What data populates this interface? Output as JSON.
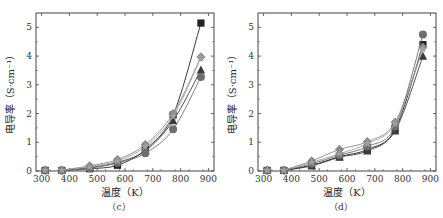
{
  "chart_data": [
    {
      "type": "line",
      "panel_label": "（c）",
      "title": "",
      "xlabel": "温度（K）",
      "ylabel": "电导率（S·cm⁻¹）",
      "xlim": [
        280,
        920
      ],
      "ylim": [
        0,
        5.5
      ],
      "xticks": [
        300,
        400,
        500,
        600,
        700,
        800,
        900
      ],
      "yticks": [
        0,
        1,
        2,
        3,
        4,
        5
      ],
      "grid": false,
      "legend": "none",
      "x": [
        313,
        373,
        473,
        573,
        673,
        773,
        873
      ],
      "series": [
        {
          "name": "square",
          "marker": "square",
          "color": "#222222",
          "values": [
            0.02,
            0.02,
            0.08,
            0.2,
            0.75,
            1.95,
            5.15
          ]
        },
        {
          "name": "diamond",
          "marker": "diamond",
          "color": "#8a8a8a",
          "values": [
            0.03,
            0.03,
            0.18,
            0.4,
            0.92,
            2.0,
            3.97
          ]
        },
        {
          "name": "triangle",
          "marker": "triangle",
          "color": "#3a3a3a",
          "values": [
            0.02,
            0.02,
            0.12,
            0.3,
            0.7,
            1.75,
            3.52
          ]
        },
        {
          "name": "circle",
          "marker": "circle",
          "color": "#6e6e6e",
          "values": [
            0.02,
            0.02,
            0.1,
            0.28,
            0.62,
            1.45,
            3.27
          ]
        },
        {
          "name": "star",
          "marker": "star",
          "color": "#a0a0a0",
          "values": [
            0.03,
            0.03,
            0.15,
            0.35,
            0.85,
            1.9,
            3.95
          ]
        }
      ]
    },
    {
      "type": "line",
      "panel_label": "（d）",
      "title": "",
      "xlabel": "温度（K）",
      "ylabel": "电导率（S·cm⁻¹）",
      "xlim": [
        280,
        920
      ],
      "ylim": [
        0,
        5.5
      ],
      "xticks": [
        300,
        400,
        500,
        600,
        700,
        800,
        900
      ],
      "yticks": [
        0,
        1,
        2,
        3,
        4,
        5
      ],
      "grid": false,
      "legend": "none",
      "x": [
        313,
        373,
        473,
        573,
        673,
        773,
        873
      ],
      "series": [
        {
          "name": "square",
          "marker": "square",
          "color": "#222222",
          "values": [
            0.02,
            0.02,
            0.2,
            0.5,
            0.75,
            1.45,
            4.4
          ]
        },
        {
          "name": "diamond",
          "marker": "diamond",
          "color": "#8a8a8a",
          "values": [
            0.03,
            0.03,
            0.35,
            0.75,
            1.02,
            1.7,
            4.3
          ]
        },
        {
          "name": "triangle",
          "marker": "triangle",
          "color": "#3a3a3a",
          "values": [
            0.02,
            0.02,
            0.18,
            0.48,
            0.7,
            1.4,
            4.0
          ]
        },
        {
          "name": "circle",
          "marker": "circle",
          "color": "#6e6e6e",
          "values": [
            0.02,
            0.02,
            0.25,
            0.55,
            0.85,
            1.55,
            4.75
          ]
        },
        {
          "name": "star",
          "marker": "star",
          "color": "#a0a0a0",
          "values": [
            0.03,
            0.03,
            0.3,
            0.6,
            0.95,
            1.65,
            4.25
          ]
        }
      ]
    }
  ]
}
